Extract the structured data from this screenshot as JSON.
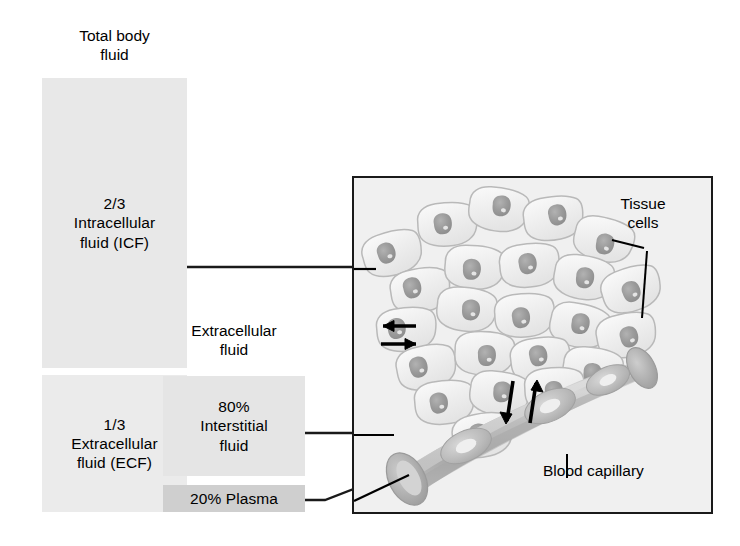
{
  "figure": {
    "title_caption": "Total body\nfluid",
    "compartments": {
      "icf": {
        "label": "2/3\nIntracellular\nfluid (ICF)",
        "fraction": "2/3",
        "name": "Intracellular fluid (ICF)",
        "fill_color": "#e8e8e8"
      },
      "ecf": {
        "label": "1/3\nExtracellular\nfluid (ECF)",
        "fraction": "1/3",
        "name": "Extracellular fluid (ECF)",
        "fill_color": "#ebebeb"
      },
      "ecf_header": {
        "label": "Extracellular\nfluid"
      },
      "interstitial": {
        "label": "80%\nInterstitial\nfluid",
        "percent": "80%",
        "name": "Interstitial fluid",
        "fill_color": "#e5e5e5"
      },
      "plasma": {
        "label": "20% Plasma",
        "percent": "20%",
        "name": "Plasma",
        "fill_color": "#cfcfcf"
      }
    },
    "panel_labels": {
      "tissue_cells": "Tissue\ncells",
      "blood_capillary": "Blood capillary"
    },
    "colors": {
      "panel_background": "#f0f0f0",
      "panel_border": "#1a1a1a",
      "cell_outline": "#b9b9b9",
      "cell_fill": "#eeeeee",
      "nucleus": "#9a9a9a",
      "capillary_wall": "#b0b0b0",
      "capillary_lumen": "#c8c8c8",
      "rbc": "#b5b5b5",
      "arrow": "#000000",
      "leader_line": "#1a1a1a"
    },
    "arrows": {
      "interstitial_exchange_count": "2",
      "capillary_exchange_count": "2"
    }
  }
}
